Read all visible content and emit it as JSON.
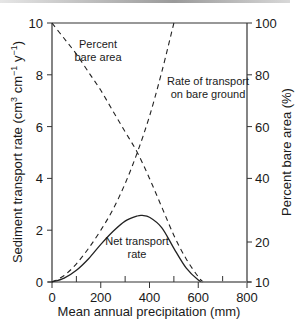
{
  "chart_data": {
    "type": "line",
    "title": "",
    "xlabel": "Mean annual precipitation (mm)",
    "ylabel_left": "Sediment transport rate (cm³ cm⁻¹ y⁻¹)",
    "ylabel_right": "Percent bare area (%)",
    "xlim": [
      0,
      800
    ],
    "ylim_left": [
      0,
      10
    ],
    "ylim_right": [
      10,
      100
    ],
    "x_ticks": [
      0,
      200,
      400,
      600,
      800
    ],
    "x_minor_ticks": [
      100,
      300,
      500,
      700
    ],
    "y_left_ticks": [
      0,
      2,
      4,
      6,
      8,
      10
    ],
    "y_right_ticks": [
      10,
      20,
      40,
      60,
      80,
      100
    ],
    "grid": false,
    "legend": "none (inline annotations)",
    "series": [
      {
        "name": "Percent bare area",
        "style": "dashed",
        "axis": "left-scale",
        "x": [
          0,
          50,
          100,
          150,
          200,
          250,
          300,
          350,
          400,
          450,
          500,
          550,
          600,
          620
        ],
        "values": [
          10,
          9.4,
          8.8,
          8.1,
          7.4,
          6.6,
          5.8,
          5.0,
          4.0,
          2.9,
          1.8,
          0.9,
          0.2,
          0.0
        ]
      },
      {
        "name": "Rate of transport on bare ground",
        "style": "dashed",
        "axis": "left",
        "x": [
          0,
          50,
          100,
          150,
          200,
          250,
          300,
          350,
          400,
          450,
          500
        ],
        "values": [
          0,
          0.25,
          0.7,
          1.3,
          2.0,
          2.8,
          3.8,
          5.0,
          6.4,
          8.1,
          10.0
        ]
      },
      {
        "name": "Net transport rate",
        "style": "solid",
        "axis": "left",
        "x": [
          0,
          50,
          100,
          150,
          200,
          250,
          300,
          350,
          370,
          400,
          450,
          500,
          550,
          600,
          620
        ],
        "values": [
          0,
          0.15,
          0.45,
          0.9,
          1.45,
          1.95,
          2.35,
          2.55,
          2.57,
          2.5,
          2.1,
          1.3,
          0.55,
          0.08,
          0.0
        ]
      }
    ],
    "annotations": [
      {
        "text": "Percent bare area",
        "x": 220,
        "y": 8.3
      },
      {
        "text": "Rate of transport on bare ground",
        "x": 560,
        "y": 7.3
      },
      {
        "text": "Net transport rate",
        "x": 330,
        "y": 1.5
      }
    ]
  },
  "labels": {
    "xlabel": "Mean annual precipitation (mm)",
    "ylabel_left": "Sediment transport rate (cm³ cm⁻¹ y⁻¹)",
    "ylabel_right": "Percent bare area (%)",
    "annot_bare_1": "Percent",
    "annot_bare_2": "bare area",
    "annot_rate_1": "Rate of transport",
    "annot_rate_2": "on bare ground",
    "annot_net_1": "Net transport",
    "annot_net_2": "rate",
    "x_ticks": [
      "0",
      "200",
      "400",
      "600",
      "800"
    ],
    "y_left_ticks": [
      "0",
      "2",
      "4",
      "6",
      "8",
      "10"
    ],
    "y_right_ticks": [
      "10",
      "20",
      "40",
      "60",
      "80",
      "100"
    ]
  }
}
